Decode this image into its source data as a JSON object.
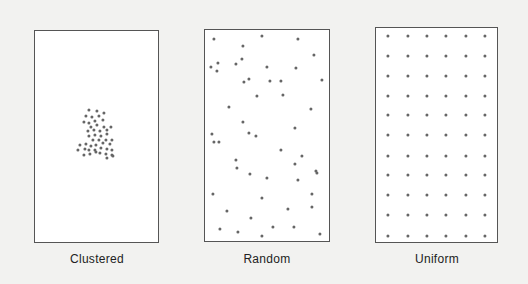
{
  "panels": [
    {
      "id": "clustered",
      "label": "Clustered",
      "box": {
        "x": 34,
        "y": 30,
        "w": 125,
        "h": 213
      },
      "label_pos": {
        "x": 97,
        "y": 252
      },
      "points": [
        [
          89,
          110
        ],
        [
          97,
          111
        ],
        [
          104,
          113
        ],
        [
          86,
          116
        ],
        [
          92,
          117
        ],
        [
          99,
          116
        ],
        [
          84,
          122
        ],
        [
          89,
          123
        ],
        [
          95,
          121
        ],
        [
          103,
          120
        ],
        [
          91,
          127
        ],
        [
          97,
          125
        ],
        [
          104,
          127
        ],
        [
          111,
          127
        ],
        [
          88,
          131
        ],
        [
          94,
          130
        ],
        [
          100,
          131
        ],
        [
          107,
          130
        ],
        [
          89,
          136
        ],
        [
          95,
          135
        ],
        [
          101,
          136
        ],
        [
          107,
          134
        ],
        [
          93,
          140
        ],
        [
          99,
          140
        ],
        [
          106,
          140
        ],
        [
          112,
          140
        ],
        [
          80,
          145
        ],
        [
          86,
          144
        ],
        [
          91,
          146
        ],
        [
          96,
          145
        ],
        [
          103,
          143
        ],
        [
          110,
          144
        ],
        [
          78,
          150
        ],
        [
          85,
          149
        ],
        [
          89,
          150
        ],
        [
          95,
          150
        ],
        [
          101,
          148
        ],
        [
          107,
          149
        ],
        [
          112,
          150
        ],
        [
          84,
          155
        ],
        [
          90,
          154
        ],
        [
          96,
          152
        ],
        [
          100,
          153
        ],
        [
          106,
          154
        ],
        [
          112,
          155
        ],
        [
          107,
          158
        ],
        [
          113,
          156
        ]
      ]
    },
    {
      "id": "random",
      "label": "Random",
      "box": {
        "x": 204,
        "y": 29,
        "w": 126,
        "h": 213
      },
      "label_pos": {
        "x": 267,
        "y": 252
      },
      "points": [
        [
          214,
          39
        ],
        [
          262,
          36
        ],
        [
          243,
          46
        ],
        [
          298,
          39
        ],
        [
          242,
          59
        ],
        [
          314,
          55
        ],
        [
          211,
          67
        ],
        [
          218,
          63
        ],
        [
          217,
          71
        ],
        [
          236,
          64
        ],
        [
          267,
          67
        ],
        [
          296,
          68
        ],
        [
          322,
          80
        ],
        [
          244,
          82
        ],
        [
          249,
          79
        ],
        [
          270,
          81
        ],
        [
          281,
          81
        ],
        [
          257,
          96
        ],
        [
          283,
          95
        ],
        [
          229,
          107
        ],
        [
          311,
          109
        ],
        [
          243,
          122
        ],
        [
          295,
          128
        ],
        [
          212,
          134
        ],
        [
          249,
          133
        ],
        [
          256,
          136
        ],
        [
          214,
          142
        ],
        [
          219,
          142
        ],
        [
          281,
          150
        ],
        [
          302,
          156
        ],
        [
          236,
          160
        ],
        [
          295,
          164
        ],
        [
          237,
          168
        ],
        [
          316,
          171
        ],
        [
          317,
          173
        ],
        [
          250,
          174
        ],
        [
          267,
          178
        ],
        [
          298,
          180
        ],
        [
          213,
          194
        ],
        [
          262,
          198
        ],
        [
          312,
          194
        ],
        [
          312,
          207
        ],
        [
          227,
          211
        ],
        [
          288,
          209
        ],
        [
          251,
          218
        ],
        [
          220,
          229
        ],
        [
          238,
          232
        ],
        [
          273,
          227
        ],
        [
          294,
          227
        ],
        [
          262,
          236
        ],
        [
          320,
          234
        ]
      ]
    },
    {
      "id": "uniform",
      "label": "Uniform",
      "box": {
        "x": 375,
        "y": 27,
        "w": 123,
        "h": 216
      },
      "label_pos": {
        "x": 437,
        "y": 252
      },
      "grid": {
        "xs": [
          388,
          408,
          427,
          446,
          466,
          485
        ],
        "ys": [
          36,
          56,
          76,
          96,
          115,
          135,
          156,
          175,
          195,
          215,
          236
        ]
      }
    }
  ],
  "dot_color": "#666666",
  "background": "#f2f2f0"
}
